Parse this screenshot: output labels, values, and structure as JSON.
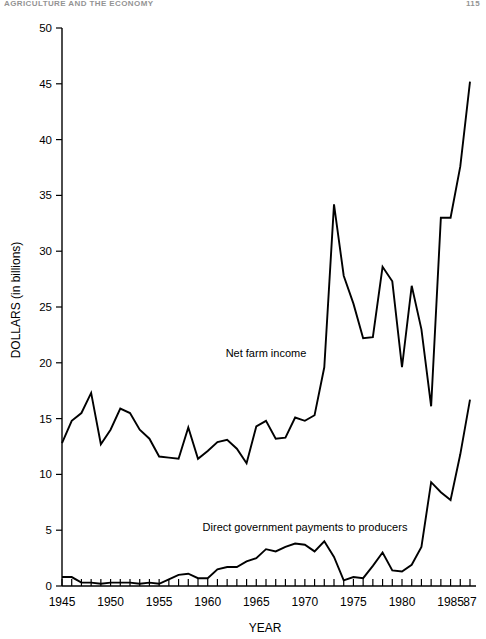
{
  "header": {
    "running_title": "AGRICULTURE AND THE ECONOMY",
    "page_number": "115"
  },
  "chart_data": {
    "type": "line",
    "title": "",
    "xlabel": "YEAR",
    "ylabel": "DOLLARS (in billions)",
    "xlim": [
      1945,
      1987
    ],
    "ylim": [
      0,
      50
    ],
    "ytick_values": [
      0,
      5,
      10,
      15,
      20,
      25,
      30,
      35,
      40,
      45,
      50
    ],
    "ytick_labels": [
      "0",
      "5",
      "10",
      "15",
      "20",
      "25",
      "30",
      "35",
      "40",
      "45",
      "50"
    ],
    "xtick_major_values": [
      1945,
      1950,
      1955,
      1960,
      1965,
      1970,
      1975,
      1980,
      1985,
      1987
    ],
    "xtick_major_labels": [
      "1945",
      "1950",
      "1955",
      "1960",
      "1965",
      "1970",
      "1975",
      "1980",
      "1985",
      "87"
    ],
    "xtick_minor_step": 1,
    "grid": false,
    "legend_position": "inline-annotation",
    "x": [
      1945,
      1946,
      1947,
      1948,
      1949,
      1950,
      1951,
      1952,
      1953,
      1954,
      1955,
      1956,
      1957,
      1958,
      1959,
      1960,
      1961,
      1962,
      1963,
      1964,
      1965,
      1966,
      1967,
      1968,
      1969,
      1970,
      1971,
      1972,
      1973,
      1974,
      1975,
      1976,
      1977,
      1978,
      1979,
      1980,
      1981,
      1982,
      1983,
      1984,
      1985,
      1986,
      1987
    ],
    "series": [
      {
        "name": "Net farm income",
        "annotation": "Net farm income",
        "values": [
          12.8,
          14.8,
          15.5,
          17.3,
          12.7,
          14.0,
          15.9,
          15.5,
          14.0,
          13.2,
          11.6,
          11.5,
          11.4,
          14.2,
          11.4,
          12.1,
          12.9,
          13.1,
          12.3,
          11.0,
          14.3,
          14.8,
          13.2,
          13.3,
          15.1,
          14.8,
          15.3,
          19.6,
          34.2,
          27.8,
          25.3,
          22.2,
          22.3,
          28.6,
          27.3,
          19.6,
          26.9,
          23.0,
          16.1,
          33.0,
          33.0,
          37.6,
          45.2
        ]
      },
      {
        "name": "Direct government payments to producers",
        "annotation": "Direct government payments to producers",
        "values": [
          0.8,
          0.8,
          0.3,
          0.3,
          0.2,
          0.3,
          0.3,
          0.3,
          0.2,
          0.3,
          0.2,
          0.6,
          1.0,
          1.1,
          0.7,
          0.7,
          1.5,
          1.7,
          1.7,
          2.2,
          2.5,
          3.3,
          3.1,
          3.5,
          3.8,
          3.7,
          3.1,
          4.0,
          2.6,
          0.5,
          0.8,
          0.7,
          1.8,
          3.0,
          1.4,
          1.3,
          1.9,
          3.5,
          9.3,
          8.4,
          7.7,
          11.8,
          16.7
        ]
      }
    ]
  }
}
